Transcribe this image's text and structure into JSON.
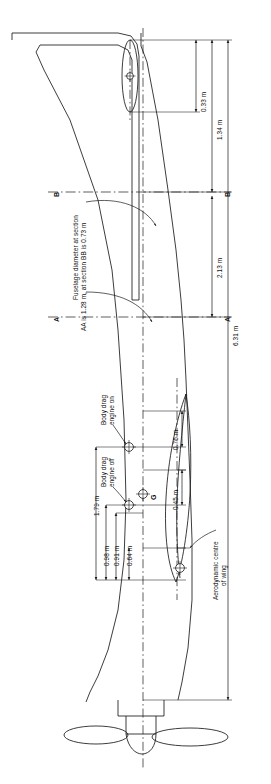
{
  "drawing": {
    "title": "Aircraft general arrangement with balance and drag reference points",
    "orientation": "rotated-90",
    "units": "m",
    "line_color": "#1a1a1a",
    "background": "#ffffff"
  },
  "dimensions": [
    {
      "id": "d-033",
      "value": "0.33 m",
      "desc": "tailplane offset from fuselage datum"
    },
    {
      "id": "d-134",
      "value": "1.34 m",
      "desc": "tail datum to section BB"
    },
    {
      "id": "d-213",
      "value": "2.13 m",
      "desc": "section BB to section AA"
    },
    {
      "id": "d-631",
      "value": "6.31 m",
      "desc": "overall fuselage length"
    },
    {
      "id": "d-179",
      "value": "1.79 m",
      "desc": "body drag engine on station to nose datum"
    },
    {
      "id": "d-098",
      "value": "0.98 m",
      "desc": "body drag engine off station to nose datum"
    },
    {
      "id": "d-091",
      "value": "0.91 m",
      "desc": "centre of gravity station to nose datum"
    },
    {
      "id": "d-076",
      "value": "0.76 m",
      "desc": "body drag engine on lateral offset"
    },
    {
      "id": "d-064",
      "value": "0.64 m",
      "desc": "centre of gravity lateral offset"
    },
    {
      "id": "d-045",
      "value": "0.45 m",
      "desc": "aerodynamic centre lateral offset"
    }
  ],
  "section_lines": [
    {
      "id": "A",
      "left_label": "A",
      "right_label": "A"
    },
    {
      "id": "B",
      "left_label": "B",
      "right_label": "B"
    }
  ],
  "notes": {
    "fuselage_diameter_line1": "Fuselage diameter at section",
    "fuselage_diameter_line2": "AA is 1.28 m, at section BB is 0.73 m"
  },
  "callouts": [
    {
      "id": "body-drag-engine-on",
      "line1": "Body drag",
      "line2": "engine on"
    },
    {
      "id": "body-drag-engine-off",
      "line1": "Body drag",
      "line2": "engine off"
    },
    {
      "id": "aerodynamic-centre",
      "line1": "Aerodynamic centre",
      "line2": "of wing"
    }
  ],
  "markers": [
    {
      "id": "cg",
      "label": "G",
      "desc": "centre of gravity"
    }
  ]
}
